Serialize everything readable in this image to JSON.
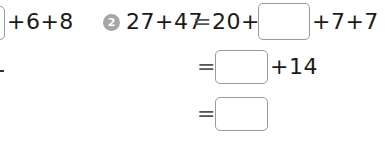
{
  "problem1_fragment": {
    "tail_text": "+6+8",
    "partial_answer_box": "empty"
  },
  "problem2": {
    "number": "2",
    "line1": {
      "lhs": "27+47",
      "equals": "=",
      "prefix": "20+",
      "answer_box": "",
      "suffix": "+7+7"
    },
    "line2": {
      "equals": "=",
      "answer_box": "",
      "suffix": "+14"
    },
    "line3": {
      "equals": "=",
      "answer_box": ""
    }
  },
  "colors": {
    "badge": "#a6a6a6",
    "box_border": "#9a9a9a",
    "text": "#1a1a1a"
  }
}
